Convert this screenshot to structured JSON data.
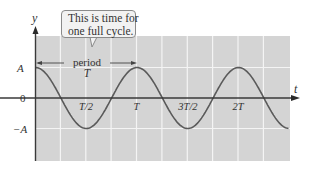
{
  "diagram": {
    "callout": {
      "line1": "This is time for",
      "line2": "one full cycle."
    },
    "period_label": {
      "word": "period",
      "symbol": "T"
    },
    "axes": {
      "y_label": "y",
      "x_label": "t",
      "y_ticks": [
        "A",
        "0",
        "−A"
      ],
      "x_ticks": [
        "T/2",
        "T",
        "3T/2",
        "2T"
      ]
    },
    "colors": {
      "grid_background": "#d4d4d4",
      "grid_lines": "#f4f4f4",
      "curve": "#5a5a5a",
      "axis": "#3a3a3a",
      "text": "#333333"
    }
  },
  "chart_data": {
    "type": "line",
    "title": "",
    "xlabel": "t",
    "ylabel": "y",
    "function": "y = A cos(2π t / T)",
    "x_tick_labels": [
      "T/2",
      "T",
      "3T/2",
      "2T"
    ],
    "y_tick_labels": [
      "A",
      "0",
      "-A"
    ],
    "x_range_in_periods": [
      0,
      2.5
    ],
    "y_range": [
      -1,
      1
    ],
    "grid": true,
    "annotations": [
      {
        "text": "period T",
        "from_t": 0,
        "to_t": 1
      },
      {
        "text": "This is time for one full cycle.",
        "points_to": "period T"
      }
    ],
    "series": [
      {
        "name": "y(t)",
        "x": [
          0,
          0.25,
          0.5,
          0.75,
          1.0,
          1.25,
          1.5,
          1.75,
          2.0,
          2.25,
          2.5
        ],
        "values": [
          1,
          0,
          -1,
          0,
          1,
          0,
          -1,
          0,
          1,
          0,
          -1
        ]
      }
    ]
  }
}
